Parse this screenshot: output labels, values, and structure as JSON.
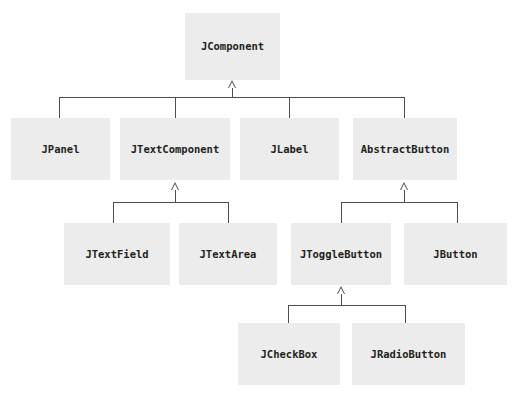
{
  "diagram": {
    "type": "uml-class-hierarchy",
    "background_color": "#ffffff",
    "node_fill_color": "#ececec",
    "node_text_color": "#231f20",
    "edge_color": "#4d4d4d",
    "arrowhead_style": "hollow-triangle-generalization"
  },
  "nodes": {
    "jcomponent": {
      "label": "JComponent"
    },
    "jpanel": {
      "label": "JPanel"
    },
    "jtextcomponent": {
      "label": "JTextComponent"
    },
    "jlabel": {
      "label": "JLabel"
    },
    "abstractbutton": {
      "label": "AbstractButton"
    },
    "jtextfield": {
      "label": "JTextField"
    },
    "jtextarea": {
      "label": "JTextArea"
    },
    "jtogglebutton": {
      "label": "JToggleButton"
    },
    "jbutton": {
      "label": "JButton"
    },
    "jcheckbox": {
      "label": "JCheckBox"
    },
    "jradiobutton": {
      "label": "JRadioButton"
    }
  },
  "edges": [
    {
      "from": "jpanel",
      "to": "jcomponent",
      "relation": "extends"
    },
    {
      "from": "jtextcomponent",
      "to": "jcomponent",
      "relation": "extends"
    },
    {
      "from": "jlabel",
      "to": "jcomponent",
      "relation": "extends"
    },
    {
      "from": "abstractbutton",
      "to": "jcomponent",
      "relation": "extends"
    },
    {
      "from": "jtextfield",
      "to": "jtextcomponent",
      "relation": "extends"
    },
    {
      "from": "jtextarea",
      "to": "jtextcomponent",
      "relation": "extends"
    },
    {
      "from": "jtogglebutton",
      "to": "abstractbutton",
      "relation": "extends"
    },
    {
      "from": "jbutton",
      "to": "abstractbutton",
      "relation": "extends"
    },
    {
      "from": "jcheckbox",
      "to": "jtogglebutton",
      "relation": "extends"
    },
    {
      "from": "jradiobutton",
      "to": "jtogglebutton",
      "relation": "extends"
    }
  ]
}
